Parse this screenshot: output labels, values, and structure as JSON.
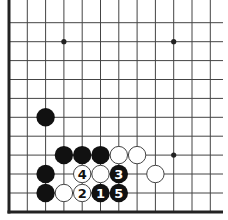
{
  "diagram": {
    "type": "go-board-fragment",
    "visible_edges": [
      "left",
      "bottom"
    ],
    "grid": {
      "columns": 12,
      "rows": 11,
      "col_x": [
        9,
        27.3,
        45.6,
        63.9,
        82.2,
        100.5,
        118.8,
        137.1,
        155.4,
        173.7,
        192,
        210.3
      ],
      "row_y": [
        22.7,
        41.7,
        60.6,
        79.5,
        98.4,
        117.3,
        136.2,
        155.1,
        174,
        193,
        212
      ],
      "right_extent": 223,
      "top_extent": 0
    },
    "colors": {
      "line": "#444444",
      "edge": "#222222",
      "black_stone": "#111111",
      "white_stone": "#ffffff",
      "white_stone_stroke": "#444444",
      "label_on_black": "#ffffff",
      "label_on_white": "#111111"
    },
    "star_points": [
      {
        "col": 3,
        "row": 1
      },
      {
        "col": 9,
        "row": 1
      },
      {
        "col": 9,
        "row": 7
      }
    ],
    "stones": [
      {
        "color": "black",
        "col": 2,
        "row": 5,
        "label": ""
      },
      {
        "color": "black",
        "col": 3,
        "row": 7,
        "label": ""
      },
      {
        "color": "black",
        "col": 4,
        "row": 7,
        "label": ""
      },
      {
        "color": "black",
        "col": 5,
        "row": 7,
        "label": ""
      },
      {
        "color": "white",
        "col": 6,
        "row": 7,
        "label": ""
      },
      {
        "color": "white",
        "col": 7,
        "row": 7,
        "label": ""
      },
      {
        "color": "black",
        "col": 2,
        "row": 8,
        "label": ""
      },
      {
        "color": "white",
        "col": 4,
        "row": 8,
        "label": "4"
      },
      {
        "color": "white",
        "col": 5,
        "row": 8,
        "label": ""
      },
      {
        "color": "black",
        "col": 6,
        "row": 8,
        "label": "3"
      },
      {
        "color": "white",
        "col": 8,
        "row": 8,
        "label": ""
      },
      {
        "color": "black",
        "col": 2,
        "row": 9,
        "label": ""
      },
      {
        "color": "white",
        "col": 3,
        "row": 9,
        "label": ""
      },
      {
        "color": "white",
        "col": 4,
        "row": 9,
        "label": "2"
      },
      {
        "color": "black",
        "col": 5,
        "row": 9,
        "label": "1"
      },
      {
        "color": "black",
        "col": 6,
        "row": 9,
        "label": "5"
      }
    ],
    "stone_radius": 9.2
  }
}
